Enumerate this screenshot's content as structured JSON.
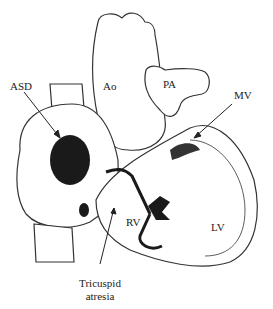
{
  "figure": {
    "labels": {
      "asd": "ASD",
      "ao": "Ao",
      "pa": "PA",
      "mv": "MV",
      "rv": "RV",
      "lv": "LV",
      "tricuspid_line1": "Tricuspid",
      "tricuspid_line2": "atresia"
    },
    "colors": {
      "ink": "#222222",
      "fill": "#ffffff",
      "dark": "#1a1a1a"
    }
  }
}
